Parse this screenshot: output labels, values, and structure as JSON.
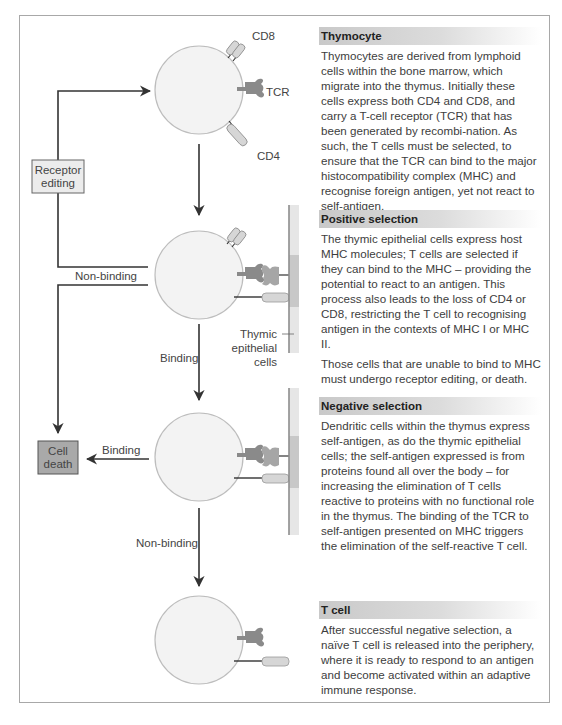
{
  "diagram": {
    "labels": {
      "cd8": "CD8",
      "tcr": "TCR",
      "cd4": "CD4",
      "receptor_editing_line1": "Receptor",
      "receptor_editing_line2": "editing",
      "non_binding_positive": "Non-binding",
      "binding_positive": "Binding",
      "thymic_line1": "Thymic",
      "thymic_line2": "epithelial",
      "thymic_line3": "cells",
      "cell_death_line1": "Cell",
      "cell_death_line2": "death",
      "binding_negative": "Binding",
      "non_binding_negative": "Non-binding"
    },
    "colors": {
      "cell_fill": "#f3f3f3",
      "cell_stroke": "#bdbdbd",
      "tcr": "#8a8a8a",
      "mhc": "#a6a6a6",
      "coreceptor": "#d6d6d6",
      "epithelium": "#e6e6e6",
      "epithelium_mid": "#c8c8c8",
      "arrow": "#333333",
      "cell_death_box": "#a9a9a9",
      "receptor_editing_box": "#ececec"
    }
  },
  "panels": [
    {
      "title": "Thymocyte",
      "paragraphs": [
        "Thymocytes are derived from lymphoid cells within the bone marrow, which migrate into the thymus. Initially these cells express both CD4 and CD8, and carry a T-cell receptor (TCR) that has been generated by recombi-nation. As such, the T cells must be selected, to ensure that the TCR can bind to the major histocompatibility complex (MHC) and recognise foreign antigen, yet not react to self-antigen."
      ]
    },
    {
      "title": "Positive selection",
      "paragraphs": [
        "The thymic epithelial cells express host MHC molecules; T cells are selected if they can bind to the MHC – providing the potential to react to an antigen. This process also leads to the loss of CD4 or CD8, restricting the T cell to recognising antigen in the contexts of MHC I or MHC II.",
        "Those cells that are unable to bind to MHC must undergo receptor editing, or death."
      ]
    },
    {
      "title": "Negative selection",
      "paragraphs": [
        "Dendritic cells within the thymus express self-antigen, as do the thymic epithelial cells; the self-antigen expressed is from proteins found all over the body – for increasing the elimination of T cells reactive to proteins with no functional role in the thymus. The binding of the TCR to self-antigen presented on MHC triggers the elimination of the self-reactive T cell."
      ]
    },
    {
      "title": "T cell",
      "paragraphs": [
        "After successful negative selection, a naïve T cell is released into the periphery, where it is ready to respond to an antigen and become activated within an adaptive immune response."
      ]
    }
  ]
}
